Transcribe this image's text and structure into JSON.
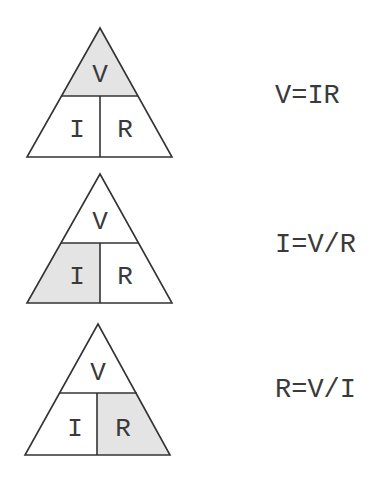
{
  "colors": {
    "highlight": "#e4e4e4",
    "plain": "#ffffff",
    "stroke": "#333333",
    "text": "#3a3a3a"
  },
  "triangles": [
    {
      "top": "V",
      "bottom_left": "I",
      "bottom_right": "R",
      "highlighted": "top",
      "formula": "V=IR"
    },
    {
      "top": "V",
      "bottom_left": "I",
      "bottom_right": "R",
      "highlighted": "bottom_left",
      "formula": "I=V/R"
    },
    {
      "top": "V",
      "bottom_left": "I",
      "bottom_right": "R",
      "highlighted": "bottom_right",
      "formula": "R=V/I"
    }
  ]
}
